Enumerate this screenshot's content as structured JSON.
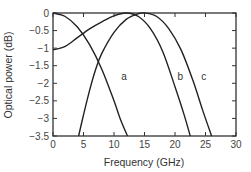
{
  "chart_data": {
    "type": "line",
    "title": "",
    "xlabel": "Frequency (GHz)",
    "ylabel": "Optical power (dB)",
    "xlim": [
      0,
      30
    ],
    "ylim": [
      -3.5,
      0
    ],
    "xticks": [
      0,
      5,
      10,
      15,
      20,
      25,
      30
    ],
    "yticks": [
      0,
      -0.5,
      -1,
      -1.5,
      -2,
      -2.5,
      -3,
      -3.5
    ],
    "xtick_labels": [
      "0",
      "5",
      "10",
      "15",
      "20",
      "25",
      "30"
    ],
    "ytick_labels": [
      "0",
      "−0.5",
      "−1",
      "−1.5",
      "−2",
      "−2.5",
      "−3",
      "−3.5"
    ],
    "grid": false,
    "legend": false,
    "series": [
      {
        "name": "a",
        "x": [
          0,
          2,
          4,
          6,
          8,
          10,
          11,
          12.2
        ],
        "y": [
          0,
          -0.1,
          -0.4,
          -0.9,
          -1.6,
          -2.5,
          -3.0,
          -3.5
        ]
      },
      {
        "name": "b",
        "x": [
          0,
          2,
          4,
          6,
          8,
          10,
          12,
          14,
          16,
          18,
          20,
          21.5,
          22.5
        ],
        "y": [
          -1.05,
          -0.95,
          -0.7,
          -0.45,
          -0.25,
          -0.08,
          0,
          -0.1,
          -0.45,
          -1.1,
          -2.1,
          -2.9,
          -3.5
        ]
      },
      {
        "name": "c",
        "x": [
          4.2,
          5,
          6,
          7,
          8,
          10,
          12,
          14,
          15,
          17,
          19,
          21,
          23,
          24.5,
          26
        ],
        "y": [
          -3.5,
          -2.9,
          -2.2,
          -1.6,
          -1.15,
          -0.55,
          -0.18,
          -0.02,
          0,
          -0.1,
          -0.45,
          -1.05,
          -1.95,
          -2.75,
          -3.5
        ]
      }
    ],
    "annotations": [
      {
        "text": "a",
        "x": 11.2,
        "y": -1.9
      },
      {
        "text": "b",
        "x": 20.4,
        "y": -1.9
      },
      {
        "text": "c",
        "x": 24.3,
        "y": -1.9
      }
    ]
  }
}
